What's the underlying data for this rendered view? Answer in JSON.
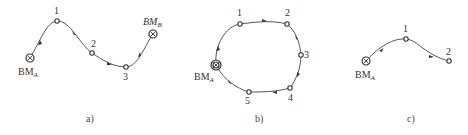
{
  "figure": {
    "panels": [
      {
        "id": "a",
        "caption": "a)",
        "route_type": "attached leveling route",
        "start": {
          "label_main": "BM",
          "label_sub": "A"
        },
        "end": {
          "label_main": "BM",
          "label_sub": "B"
        },
        "stations": [
          "1",
          "2",
          "3"
        ]
      },
      {
        "id": "b",
        "caption": "b)",
        "route_type": "closed leveling route",
        "start": {
          "label_main": "BM",
          "label_sub": "A"
        },
        "stations": [
          "1",
          "2",
          "3",
          "4",
          "5"
        ]
      },
      {
        "id": "c",
        "caption": "c)",
        "route_type": "branch leveling route",
        "start": {
          "label_main": "BM",
          "label_sub": "A"
        },
        "stations": [
          "1",
          "2"
        ]
      }
    ],
    "colors": {
      "line": "#555555",
      "marker": "#333333",
      "text": "#333333",
      "background": "#ffffff"
    }
  }
}
